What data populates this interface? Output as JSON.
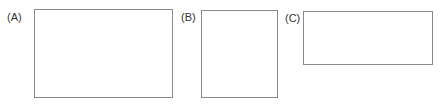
{
  "figure": {
    "panels": [
      {
        "id": "A",
        "label": "(A)",
        "x": 34,
        "y": 9,
        "w": 139,
        "h": 89
      },
      {
        "id": "B",
        "label": "(B)",
        "x": 201,
        "y": 10,
        "w": 77,
        "h": 88
      },
      {
        "id": "C",
        "label": "(C)",
        "x": 303,
        "y": 11,
        "w": 130,
        "h": 54
      }
    ],
    "colors": {
      "border": "#8a8a8a",
      "label": "#333333"
    }
  }
}
